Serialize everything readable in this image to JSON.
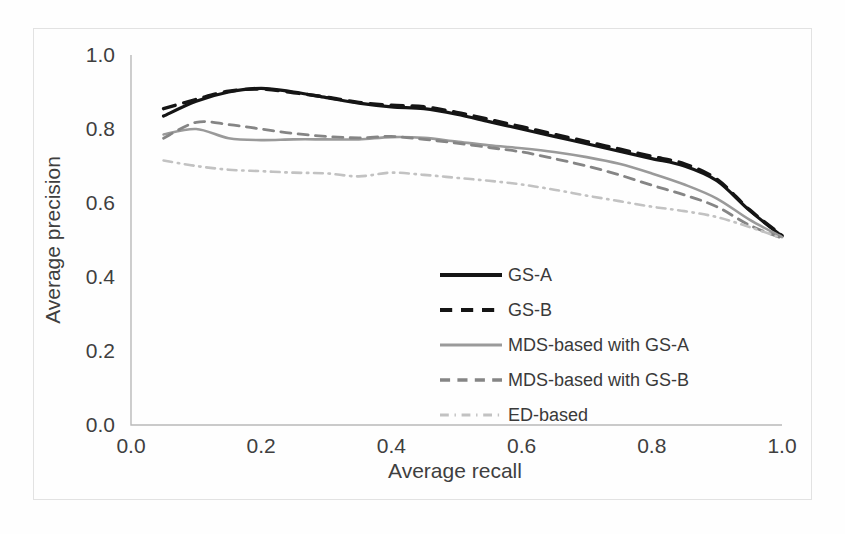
{
  "chart_data": {
    "type": "line",
    "title": "",
    "xlabel": "Average recall",
    "ylabel": "Average precision",
    "xlim": [
      0.0,
      1.0
    ],
    "ylim": [
      0.0,
      1.0
    ],
    "xticks": [
      "0.0",
      "0.2",
      "0.4",
      "0.6",
      "0.8",
      "1.0"
    ],
    "xtick_values": [
      0.0,
      0.2,
      0.4,
      0.6,
      0.8,
      1.0
    ],
    "yticks": [
      "0.0",
      "0.2",
      "0.4",
      "0.6",
      "0.8",
      "1.0"
    ],
    "ytick_values": [
      0.0,
      0.2,
      0.4,
      0.6,
      0.8,
      1.0
    ],
    "grid": false,
    "legend_position": "center",
    "x": [
      0.05,
      0.1,
      0.15,
      0.2,
      0.25,
      0.3,
      0.35,
      0.4,
      0.45,
      0.5,
      0.55,
      0.6,
      0.65,
      0.7,
      0.75,
      0.8,
      0.85,
      0.9,
      0.95,
      1.0
    ],
    "series": [
      {
        "name": "GS-A",
        "color": "#151515",
        "style": "solid",
        "width": 3.2,
        "values": [
          0.835,
          0.875,
          0.9,
          0.91,
          0.9,
          0.885,
          0.87,
          0.86,
          0.855,
          0.84,
          0.82,
          0.8,
          0.78,
          0.76,
          0.74,
          0.72,
          0.7,
          0.66,
          0.58,
          0.51
        ]
      },
      {
        "name": "GS-B",
        "color": "#151515",
        "style": "dashed",
        "width": 3.4,
        "values": [
          0.855,
          0.88,
          0.902,
          0.908,
          0.898,
          0.886,
          0.872,
          0.864,
          0.86,
          0.845,
          0.826,
          0.806,
          0.786,
          0.766,
          0.746,
          0.726,
          0.706,
          0.664,
          0.582,
          0.512
        ]
      },
      {
        "name": "MDS-based with GS-A",
        "color": "#9a9a9a",
        "style": "solid",
        "width": 2.6,
        "values": [
          0.785,
          0.8,
          0.775,
          0.77,
          0.772,
          0.772,
          0.772,
          0.778,
          0.776,
          0.766,
          0.756,
          0.748,
          0.738,
          0.724,
          0.706,
          0.68,
          0.65,
          0.612,
          0.555,
          0.508
        ]
      },
      {
        "name": "MDS-based with GS-B",
        "color": "#858585",
        "style": "dashed",
        "width": 2.8,
        "values": [
          0.775,
          0.818,
          0.812,
          0.8,
          0.788,
          0.78,
          0.776,
          0.78,
          0.772,
          0.762,
          0.75,
          0.738,
          0.72,
          0.7,
          0.676,
          0.648,
          0.622,
          0.59,
          0.54,
          0.505
        ]
      },
      {
        "name": "ED-based",
        "color": "#c2c2c2",
        "style": "dashdot",
        "width": 2.6,
        "values": [
          0.715,
          0.7,
          0.69,
          0.686,
          0.682,
          0.68,
          0.672,
          0.682,
          0.676,
          0.668,
          0.66,
          0.65,
          0.636,
          0.62,
          0.605,
          0.59,
          0.578,
          0.562,
          0.535,
          0.505
        ]
      }
    ]
  },
  "legend": {
    "entries": [
      {
        "label": "GS-A"
      },
      {
        "label": "GS-B"
      },
      {
        "label": "MDS-based with GS-A"
      },
      {
        "label": "MDS-based with GS-B"
      },
      {
        "label": "ED-based"
      }
    ]
  }
}
